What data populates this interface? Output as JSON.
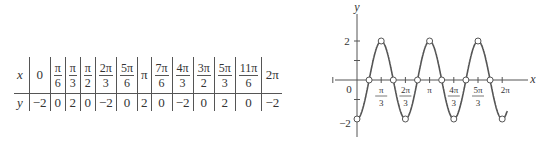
{
  "table": {
    "x_label": "x",
    "y_label": "y",
    "columns": [
      {
        "x_num": "0",
        "x_den": "",
        "y": "−2"
      },
      {
        "x_num": "π",
        "x_den": "6",
        "y": "0"
      },
      {
        "x_num": "π",
        "x_den": "3",
        "y": "2"
      },
      {
        "x_num": "π",
        "x_den": "2",
        "y": "0"
      },
      {
        "x_num": "2π",
        "x_den": "3",
        "y": "−2"
      },
      {
        "x_num": "5π",
        "x_den": "6",
        "y": "0"
      },
      {
        "x_num": "π",
        "x_den": "",
        "y": "2"
      },
      {
        "x_num": "7π",
        "x_den": "6",
        "y": "0"
      },
      {
        "x_num": "4π",
        "x_den": "3",
        "y": "−2"
      },
      {
        "x_num": "3π",
        "x_den": "2",
        "y": "0"
      },
      {
        "x_num": "5π",
        "x_den": "3",
        "y": "2"
      },
      {
        "x_num": "11π",
        "x_den": "6",
        "y": "0"
      },
      {
        "x_num": "2π",
        "x_den": "",
        "y": "−2"
      }
    ]
  },
  "graph": {
    "function": "y = -2cos(3x)",
    "x_axis_label": "x",
    "y_axis_label": "y",
    "origin_label": "0",
    "y_tick_labels": [
      "2",
      "−2"
    ],
    "x_tick_labels": [
      {
        "num": "π",
        "den": "3"
      },
      {
        "num": "2π",
        "den": "3"
      },
      {
        "num": "π",
        "den": ""
      },
      {
        "num": "4π",
        "den": "3"
      },
      {
        "num": "5π",
        "den": "3"
      },
      {
        "num": "2π",
        "den": ""
      }
    ],
    "curve_color": "#555555"
  }
}
